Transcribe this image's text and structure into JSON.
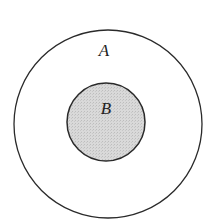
{
  "diagram": {
    "type": "venn-subset",
    "sets": [
      {
        "label": "A",
        "role": "outer",
        "fill": "#ffffff",
        "stroke": "#2a2a2a"
      },
      {
        "label": "B",
        "role": "inner",
        "fill": "#d6d6d6",
        "stroke": "#2a2a2a"
      }
    ],
    "relation": "B is a subset of A"
  }
}
